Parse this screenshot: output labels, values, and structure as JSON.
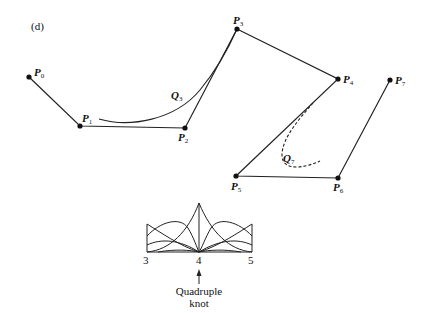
{
  "figure": {
    "panel_label": "(d)",
    "control_points": [
      {
        "name": "P",
        "sub": "0",
        "x": 29,
        "y": 77
      },
      {
        "name": "P",
        "sub": "1",
        "x": 80,
        "y": 126
      },
      {
        "name": "P",
        "sub": "2",
        "x": 185,
        "y": 128
      },
      {
        "name": "P",
        "sub": "3",
        "x": 237,
        "y": 29
      },
      {
        "name": "P",
        "sub": "4",
        "x": 338,
        "y": 79
      },
      {
        "name": "P",
        "sub": "5",
        "x": 236,
        "y": 176
      },
      {
        "name": "P",
        "sub": "6",
        "x": 338,
        "y": 178
      },
      {
        "name": "P",
        "sub": "7",
        "x": 390,
        "y": 80
      }
    ],
    "curves": [
      {
        "name": "Q",
        "sub": "3",
        "style": "solid"
      },
      {
        "name": "Q",
        "sub": "7",
        "style": "dashed"
      }
    ],
    "basis_plot": {
      "tick_labels": [
        "3",
        "4",
        "5"
      ],
      "annotation_line1": "Quadruple",
      "annotation_line2": "knot"
    }
  }
}
